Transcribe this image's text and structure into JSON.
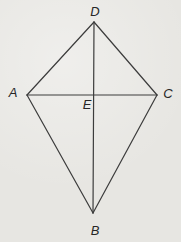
{
  "diagram": {
    "type": "geometry-kite",
    "background_color": "#e7e6e2",
    "stroke_color": "#3c3c3c",
    "label_color": "#262626",
    "points": {
      "D": {
        "label": "D",
        "x": 94,
        "y": 22,
        "label_x": 95,
        "label_y": 11
      },
      "A": {
        "label": "A",
        "x": 27,
        "y": 95,
        "label_x": 13,
        "label_y": 92
      },
      "C": {
        "label": "C",
        "x": 157,
        "y": 95,
        "label_x": 168,
        "label_y": 93
      },
      "B": {
        "label": "B",
        "x": 93,
        "y": 213,
        "label_x": 95,
        "label_y": 230
      },
      "E": {
        "label": "E",
        "x": 93,
        "y": 94.5,
        "label_x": 87,
        "label_y": 104
      }
    },
    "edges": [
      {
        "from": "D",
        "to": "A"
      },
      {
        "from": "D",
        "to": "C"
      },
      {
        "from": "A",
        "to": "B"
      },
      {
        "from": "C",
        "to": "B"
      },
      {
        "from": "A",
        "to": "C"
      },
      {
        "from": "D",
        "to": "B"
      }
    ]
  }
}
